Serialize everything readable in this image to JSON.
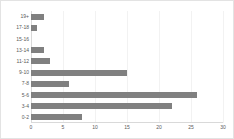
{
  "chart_data": {
    "type": "bar",
    "orientation": "horizontal",
    "title": "",
    "subtitle": "",
    "xlabel": "",
    "ylabel": "",
    "categories": [
      "0-2",
      "3-4",
      "5-6",
      "7-8",
      "9-10",
      "11-12",
      "13-14",
      "15-16",
      "17-18",
      "19+"
    ],
    "values": [
      8,
      22,
      26,
      6,
      15,
      3,
      2,
      0,
      1,
      2
    ],
    "series": [
      {
        "name": "",
        "values": [
          8,
          22,
          26,
          6,
          15,
          3,
          2,
          0,
          1,
          2
        ]
      }
    ],
    "xlim": [
      0,
      30
    ],
    "xticks": [
      0,
      5,
      10,
      15,
      20,
      25,
      30
    ],
    "xtick_labels": [
      "0",
      "5",
      "10",
      "15",
      "20",
      "25",
      "30"
    ],
    "ytick_labels": [
      "19+",
      "17-18",
      "15-16",
      "13-14",
      "11-12",
      "9-10",
      "7-8",
      "5-6",
      "3-4",
      "0-2"
    ],
    "grid": true,
    "grid_axis": "x",
    "legend": false,
    "legend_position": "none",
    "bar_color": "#808080",
    "gridline_color": "#f2f2f2",
    "axis_color": "#d9d9d9",
    "tick_label_color": "#595959",
    "background_color": "#ffffff",
    "border_color": "#e3e3e3"
  }
}
